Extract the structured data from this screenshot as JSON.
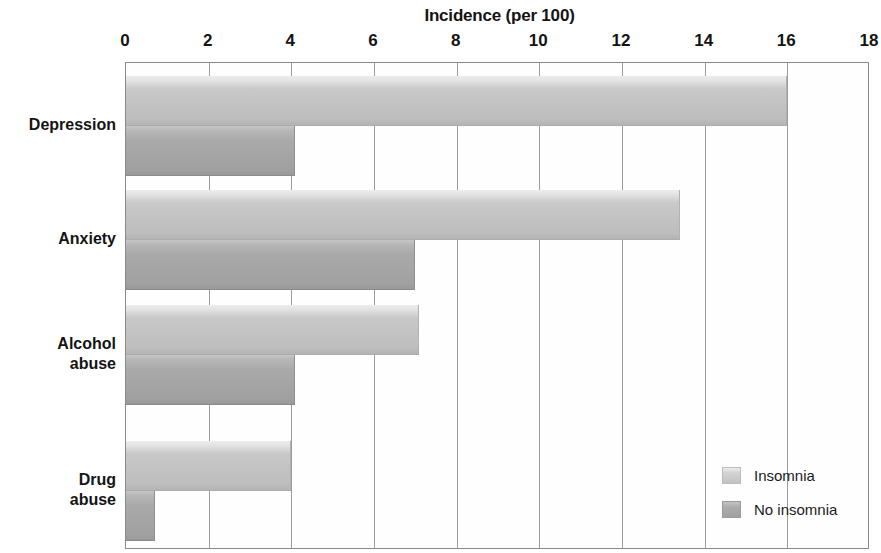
{
  "chart_data": {
    "type": "bar",
    "orientation": "horizontal",
    "title": "Incidence (per 100)",
    "xlabel": "Incidence (per 100)",
    "ylabel": "",
    "xlim": [
      0,
      18
    ],
    "xticks": [
      0,
      2,
      4,
      6,
      8,
      10,
      12,
      14,
      16,
      18
    ],
    "xtick_labels": [
      "0",
      "2",
      "4",
      "6",
      "8",
      "10",
      "12",
      "14",
      "16",
      "18"
    ],
    "grid": "vertical",
    "legend_position": "middle-right-inside",
    "categories": [
      "Depression",
      "Anxiety",
      "Alcohol\nabuse",
      "Drug\nabuse"
    ],
    "series": [
      {
        "name": "Insomnia",
        "color": "#c2c2c2",
        "values": [
          16.0,
          13.4,
          7.1,
          4.0
        ]
      },
      {
        "name": "No insomnia",
        "color": "#a4a4a4",
        "values": [
          4.1,
          7.0,
          4.1,
          0.7
        ]
      }
    ]
  },
  "legend": {
    "items": [
      {
        "label": "Insomnia",
        "swatch_class": "sw-insomnia"
      },
      {
        "label": "No insomnia",
        "swatch_class": "sw-noinsomnia"
      }
    ]
  },
  "axis": {
    "ticks": [
      {
        "label": "0",
        "value": 0
      },
      {
        "label": "2",
        "value": 2
      },
      {
        "label": "4",
        "value": 4
      },
      {
        "label": "6",
        "value": 6
      },
      {
        "label": "8",
        "value": 8
      },
      {
        "label": "10",
        "value": 10
      },
      {
        "label": "12",
        "value": 12
      },
      {
        "label": "14",
        "value": 14
      },
      {
        "label": "16",
        "value": 16
      },
      {
        "label": "18",
        "value": 18
      }
    ]
  },
  "geometry": {
    "plot_left": 125,
    "plot_top": 62,
    "plot_width": 744,
    "plot_height": 487,
    "group_tops": [
      13,
      127,
      242,
      378
    ],
    "bar_height": 50,
    "bar_gap": 0
  }
}
